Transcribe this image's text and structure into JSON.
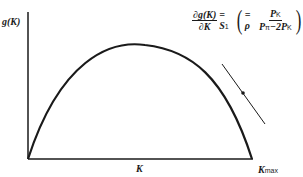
{
  "diagram": {
    "y_axis_label": "g(K)",
    "x_axis_label": "K",
    "x_max_label": "K",
    "x_max_sub": "max",
    "equation": {
      "lhs_num": "∂g(K)",
      "lhs_den": "∂K",
      "eq1": "= S",
      "eq1_sub": "1",
      "eq2": "= ρ",
      "rhs_num": "P",
      "rhs_num_sub": "K",
      "rhs_den": "P",
      "rhs_den_sub1": "π",
      "rhs_den_mid": "−2P",
      "rhs_den_sub2": "K"
    },
    "curve": "inverted parabola from origin to K_max",
    "tangent_point": "on descending side of curve"
  }
}
